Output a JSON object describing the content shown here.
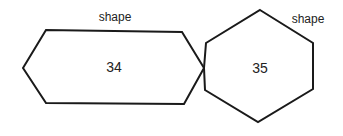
{
  "diagram": {
    "shapes": [
      {
        "id": "shape-34",
        "type": "elongated-hexagon",
        "label": "shape",
        "value": "34"
      },
      {
        "id": "shape-35",
        "type": "hexagon",
        "label": "shape",
        "value": "35"
      }
    ],
    "colors": {
      "stroke": "#1a1a1a",
      "fill": "#ffffff",
      "text": "#222222"
    }
  }
}
